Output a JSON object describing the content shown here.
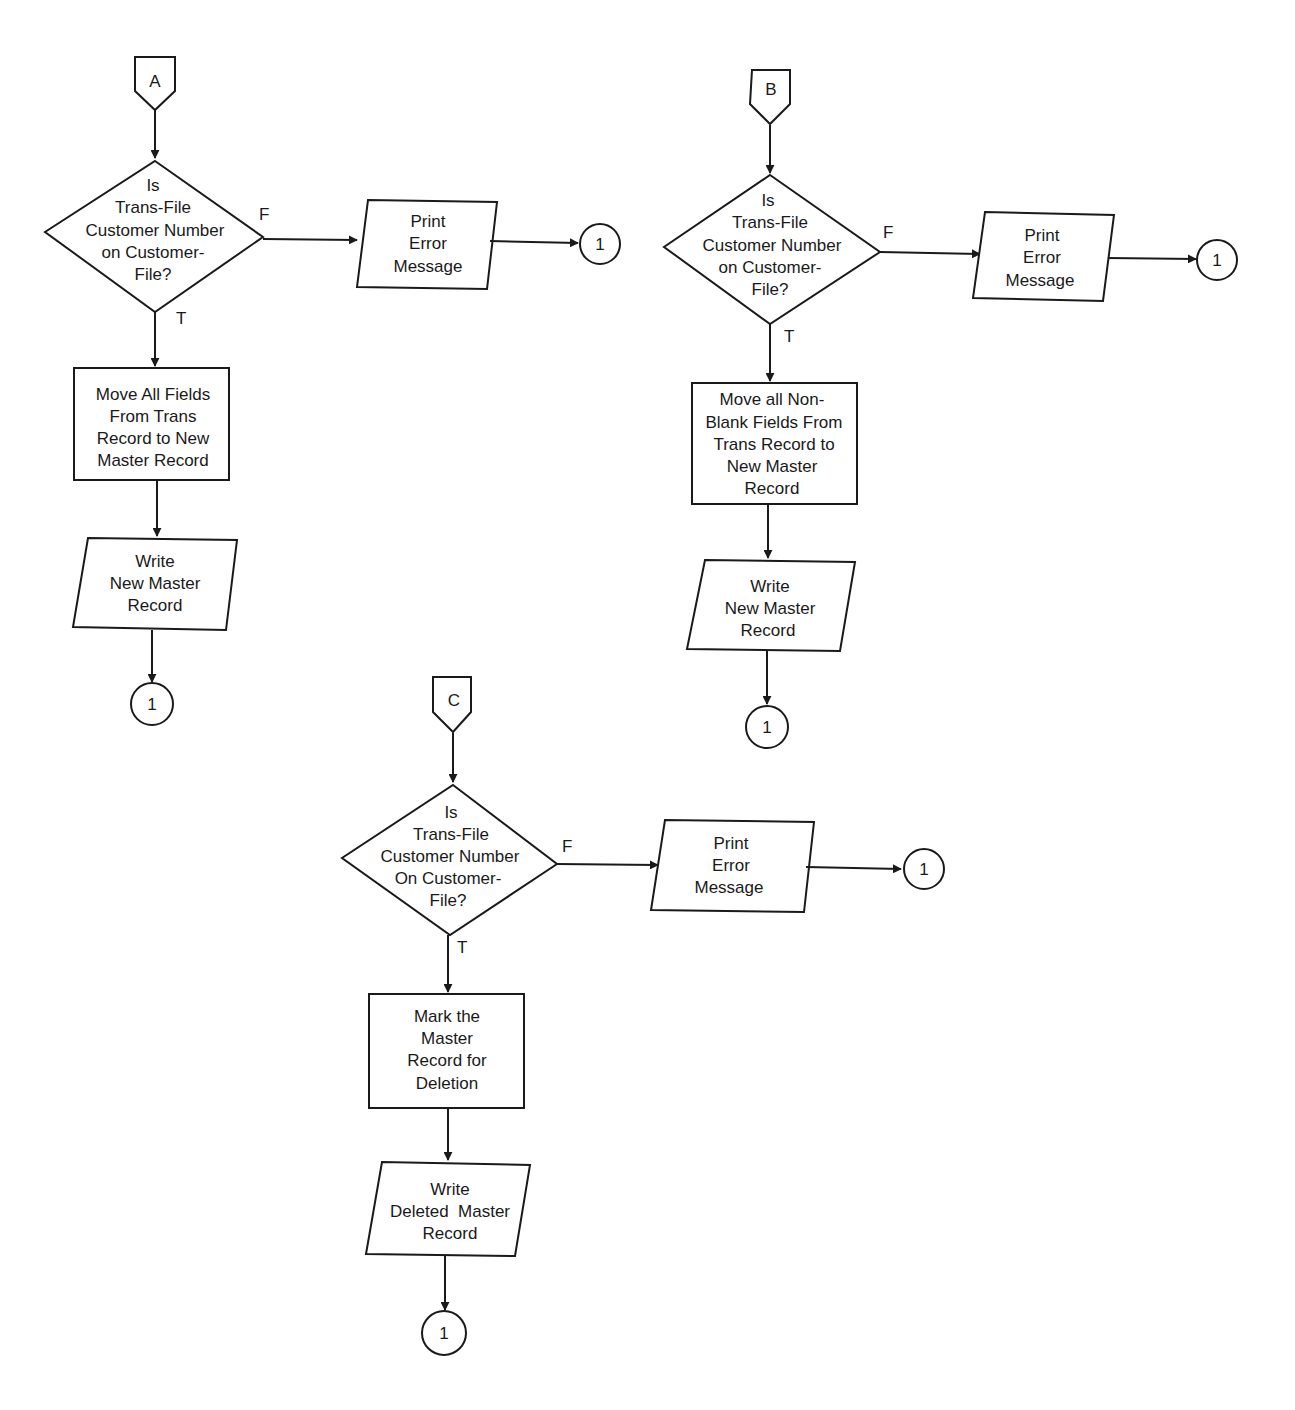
{
  "flowcharts": [
    {
      "id": "A",
      "entry_connector": "A",
      "decision": [
        "Is",
        "Trans-File",
        "Customer Number",
        "on Customer-",
        "File?"
      ],
      "false_label": "F",
      "true_label": "T",
      "error_output": [
        "Print",
        "Error",
        "Message"
      ],
      "error_connector": "1",
      "process": [
        "Move All Fields",
        "From Trans",
        "Record to New",
        "Master Record"
      ],
      "write_output": [
        "Write",
        "New Master",
        "Record"
      ],
      "exit_connector": "1"
    },
    {
      "id": "B",
      "entry_connector": "B",
      "decision": [
        "Is",
        "Trans-File",
        "Customer Number",
        "on Customer-",
        "File?"
      ],
      "false_label": "F",
      "true_label": "T",
      "error_output": [
        "Print",
        "Error",
        "Message"
      ],
      "error_connector": "1",
      "process": [
        "Move all Non-",
        "Blank Fields From",
        "Trans Record to",
        "New Master",
        "Record"
      ],
      "write_output": [
        "Write",
        "New Master",
        "Record"
      ],
      "exit_connector": "1"
    },
    {
      "id": "C",
      "entry_connector": "C",
      "decision": [
        "Is",
        "Trans-File",
        "Customer Number",
        "On Customer-",
        "File?"
      ],
      "false_label": "F",
      "true_label": "T",
      "error_output": [
        "Print",
        "Error",
        "Message"
      ],
      "error_connector": "1",
      "process": [
        "Mark the",
        "Master",
        "Record for",
        "Deletion"
      ],
      "write_output": [
        "Write",
        "Deleted  Master",
        "Record"
      ],
      "exit_connector": "1"
    }
  ]
}
